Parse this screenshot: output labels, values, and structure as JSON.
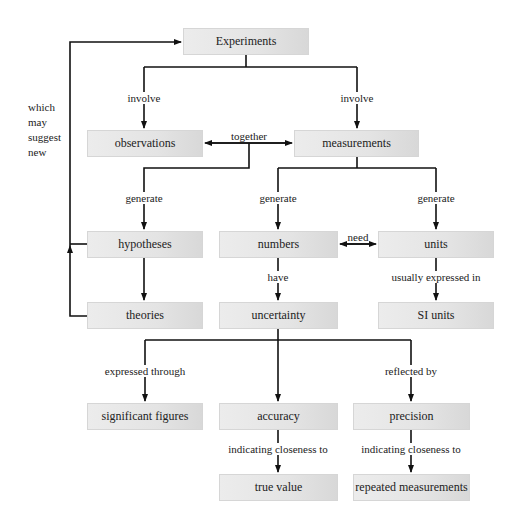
{
  "nodes": {
    "experiments": "Experiments",
    "observations": "observations",
    "measurements": "measurements",
    "hypotheses": "hypotheses",
    "numbers": "numbers",
    "units": "units",
    "theories": "theories",
    "uncertainty": "uncertainty",
    "si_units": "SI units",
    "significant_figures": "significant figures",
    "accuracy": "accuracy",
    "precision": "precision",
    "true_value": "true value",
    "repeated_measurements": "repeated measurements"
  },
  "edges": {
    "involve_left": "involve",
    "involve_right": "involve",
    "together": "together",
    "generate_hyp": "generate",
    "generate_num": "generate",
    "generate_units": "generate",
    "need": "need",
    "have": "have",
    "usually_expressed_in": "usually expressed in",
    "expressed_through": "expressed through",
    "reflected_by": "reflected by",
    "indicating_acc": "indicating closeness to",
    "indicating_prec": "indicating closeness to"
  },
  "side_note": {
    "line1": "which",
    "line2": "may",
    "line3": "suggest",
    "line4": "new"
  }
}
